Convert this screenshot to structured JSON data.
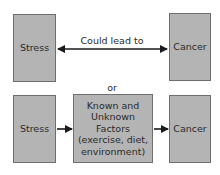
{
  "diagram": {
    "top_row": {
      "left_box": "Stress",
      "right_box": "Cancer",
      "arrow_label": "Could lead to",
      "arrow_type": "bidirectional"
    },
    "separator": "or",
    "bottom_row": {
      "left_box": "Stress",
      "middle_box": {
        "line1": "Known and",
        "line2": "Unknown",
        "line3": "Factors",
        "line4": "(exercise, diet,",
        "line5": "environment)"
      },
      "right_box": "Cancer",
      "arrow_type": "forward"
    },
    "colors": {
      "box_fill": "#b4b4b4",
      "box_border": "#6e6e6e",
      "arrow": "#1a1a1a",
      "text": "#2a2a2a"
    }
  }
}
